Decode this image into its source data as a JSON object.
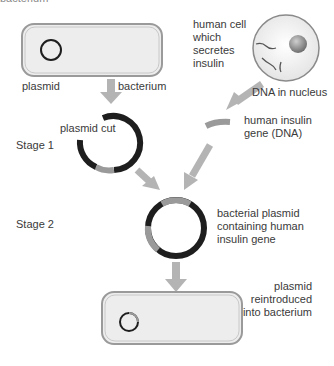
{
  "top_cutoff_text": "bacterium",
  "labels": {
    "plasmid": "plasmid",
    "bacterium": "bacterium",
    "human_cell": "human cell\nwhich\nsecretes\ninsulin",
    "dna_in_nucleus": "DNA in nucleus",
    "plasmid_cut": "plasmid cut",
    "stage1": "Stage 1",
    "human_insulin_gene": "human insulin\ngene (DNA)",
    "stage2": "Stage 2",
    "recombinant_plasmid": "bacterial plasmid\ncontaining human\ninsulin gene",
    "reintroduced": "plasmid reintroduced\ninto bacterium"
  },
  "colors": {
    "plasmid_dark": "#1e1e1e",
    "gene_gray": "#9a9a9a",
    "arrow_gray": "#b4b4b4",
    "cell_fill": "#ececec",
    "cell_outline": "#8a8a8a"
  }
}
